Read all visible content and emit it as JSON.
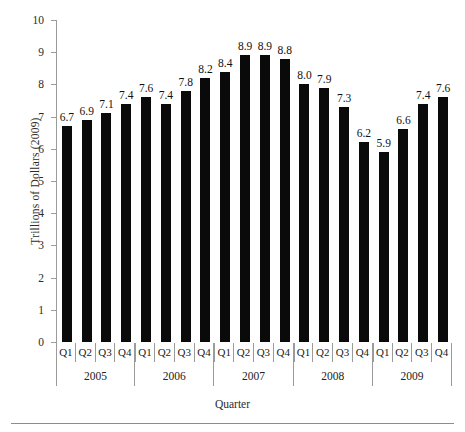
{
  "chart_data": {
    "type": "bar",
    "title": "",
    "xlabel": "Quarter",
    "ylabel": "Trillions of Dollars (2009)",
    "ylim": [
      0,
      10
    ],
    "ytick_step": 1,
    "yticks": [
      10,
      9,
      8,
      7,
      6,
      5,
      4,
      3,
      2,
      1,
      0
    ],
    "grid": false,
    "legend": "none",
    "bar_color": "#0a0a0a",
    "axis_color": "#9b9b9b",
    "categories": [
      "Q1",
      "Q2",
      "Q3",
      "Q4",
      "Q1",
      "Q2",
      "Q3",
      "Q4",
      "Q1",
      "Q2",
      "Q3",
      "Q4",
      "Q1",
      "Q2",
      "Q3",
      "Q4",
      "Q1",
      "Q2",
      "Q3",
      "Q4"
    ],
    "values": [
      6.7,
      6.9,
      7.1,
      7.4,
      7.6,
      7.4,
      7.8,
      8.2,
      8.4,
      8.9,
      8.9,
      8.8,
      8.0,
      7.9,
      7.3,
      6.2,
      5.9,
      6.6,
      7.4,
      7.6
    ],
    "value_labels": [
      "6.7",
      "6.9",
      "7.1",
      "7.4",
      "7.6",
      "7.4",
      "7.8",
      "8.2",
      "8.4",
      "8.9",
      "8.9",
      "8.8",
      "8.0",
      "7.9",
      "7.3",
      "6.2",
      "5.9",
      "6.6",
      "7.4",
      "7.6"
    ],
    "groups": [
      {
        "label": "2005",
        "span": 4
      },
      {
        "label": "2006",
        "span": 4
      },
      {
        "label": "2007",
        "span": 4
      },
      {
        "label": "2008",
        "span": 4
      },
      {
        "label": "2009",
        "span": 4
      }
    ]
  }
}
